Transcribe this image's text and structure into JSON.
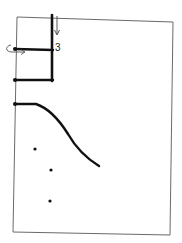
{
  "diagram": {
    "style": "hand-drawn sketch",
    "colors": {
      "background": "#ffffff",
      "frame": "#6a6a6a",
      "ink": "#111111"
    },
    "labels": [
      {
        "id": "step-number",
        "text": "3"
      }
    ],
    "elements": {
      "frame": "outer page rectangle",
      "stack": "vertical bar with two horizontal rungs",
      "down_arrow": "arrow pointing down at top of bar",
      "rotate_arrow": "curved arrow at left of upper rung",
      "curve": "line that runs flat then curves downward",
      "dots": 3
    }
  }
}
